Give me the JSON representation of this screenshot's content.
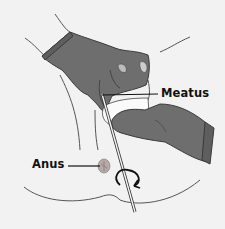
{
  "figure": {
    "labels": {
      "meatus": "Meatus",
      "anus": "Anus"
    },
    "colors": {
      "background": "#f2f2f2",
      "glove": "#6e6e6e",
      "glove_outline": "#3a3a3a",
      "skin_line": "#555555",
      "gauze": "#fafafa",
      "label_text": "#111111"
    }
  }
}
